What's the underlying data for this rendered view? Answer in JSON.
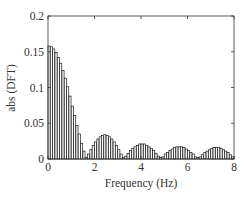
{
  "chart_data": {
    "type": "bar",
    "title": "",
    "xlabel": "Frequency (Hz)",
    "ylabel": "abs (DFT)",
    "xlim": [
      0,
      8
    ],
    "ylim": [
      0,
      0.2
    ],
    "xticks": [
      "0",
      "2",
      "4",
      "6",
      "8"
    ],
    "yticks": [
      "0",
      "0.05",
      "0.1",
      "0.15",
      "0.2"
    ],
    "grid": false,
    "legend": null,
    "bar_width_hz": 0.1,
    "x": [
      0.0,
      0.1,
      0.2,
      0.3,
      0.4,
      0.5,
      0.6,
      0.7,
      0.8,
      0.9,
      1.0,
      1.1,
      1.2,
      1.3,
      1.4,
      1.5,
      1.6,
      1.7,
      1.8,
      1.9,
      2.0,
      2.1,
      2.2,
      2.3,
      2.4,
      2.5,
      2.6,
      2.7,
      2.8,
      2.9,
      3.0,
      3.1,
      3.2,
      3.3,
      3.4,
      3.5,
      3.6,
      3.7,
      3.8,
      3.9,
      4.0,
      4.1,
      4.2,
      4.3,
      4.4,
      4.5,
      4.6,
      4.7,
      4.8,
      4.9,
      5.0,
      5.1,
      5.2,
      5.3,
      5.4,
      5.5,
      5.6,
      5.7,
      5.8,
      5.9,
      6.0,
      6.1,
      6.2,
      6.3,
      6.4,
      6.5,
      6.6,
      6.7,
      6.8,
      6.9,
      7.0,
      7.1,
      7.2,
      7.3,
      7.4,
      7.5,
      7.6,
      7.7,
      7.8,
      7.9
    ],
    "values": [
      0.158,
      0.157,
      0.154,
      0.149,
      0.142,
      0.134,
      0.124,
      0.113,
      0.101,
      0.088,
      0.074,
      0.061,
      0.047,
      0.035,
      0.022,
      0.011,
      0.002,
      0.007,
      0.013,
      0.019,
      0.024,
      0.028,
      0.031,
      0.033,
      0.034,
      0.033,
      0.031,
      0.028,
      0.024,
      0.019,
      0.013,
      0.007,
      0.002,
      0.004,
      0.008,
      0.012,
      0.015,
      0.017,
      0.019,
      0.021,
      0.021,
      0.021,
      0.019,
      0.017,
      0.015,
      0.012,
      0.008,
      0.004,
      0.002,
      0.003,
      0.007,
      0.009,
      0.012,
      0.014,
      0.016,
      0.017,
      0.017,
      0.017,
      0.016,
      0.014,
      0.012,
      0.009,
      0.007,
      0.003,
      0.002,
      0.003,
      0.006,
      0.009,
      0.011,
      0.013,
      0.015,
      0.016,
      0.016,
      0.016,
      0.015,
      0.013,
      0.011,
      0.009,
      0.006,
      0.003
    ],
    "colors": {
      "bar_fill": "#ffffff",
      "bar_edge": "#1a1a1a",
      "axes": "#333333"
    }
  }
}
